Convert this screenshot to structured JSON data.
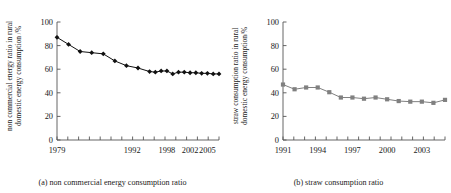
{
  "figure": {
    "panels": [
      {
        "id": "panel-a",
        "caption": "(a) non commercial energy consumption ratio",
        "ylabel": "non commercial energy ratio in rural\ndomestic energy consumption /%"
      },
      {
        "id": "panel-b",
        "caption": "(b) straw consumption ratio",
        "ylabel": "straw consumption ratio in rural\ndomestic energy consumption/%"
      }
    ]
  },
  "chart_data": [
    {
      "type": "line",
      "title": "(a) non commercial energy consumption ratio",
      "xlabel": "",
      "ylabel": "non commercial energy ratio in rural domestic energy consumption /%",
      "marker": "diamond",
      "marker_color": "#111111",
      "line_color": "#111111",
      "grid": false,
      "legend": "none",
      "xlim": [
        1979,
        2007
      ],
      "ylim": [
        0,
        100
      ],
      "yticks": [
        0,
        20,
        40,
        60,
        80,
        100
      ],
      "xticks": [
        1979,
        1992,
        1998,
        2002,
        2005
      ],
      "xtick_labels": [
        "1979",
        "1992",
        "1998",
        "2002",
        "2005"
      ],
      "x": [
        1979,
        1981,
        1983,
        1985,
        1987,
        1989,
        1991,
        1993,
        1995,
        1996,
        1997,
        1998,
        1999,
        2000,
        2001,
        2002,
        2003,
        2004,
        2005,
        2006,
        2007
      ],
      "values": [
        87,
        81,
        75,
        74,
        73,
        67,
        63,
        61,
        58,
        57.5,
        58.5,
        58.5,
        56,
        57.5,
        57.5,
        57,
        57,
        56.5,
        56.5,
        56,
        56
      ]
    },
    {
      "type": "line",
      "title": "(b) straw consumption ratio",
      "xlabel": "",
      "ylabel": "straw consumption ratio in rural domestic energy consumption/%",
      "marker": "square",
      "marker_color": "#808080",
      "line_color": "#808080",
      "grid": false,
      "legend": "none",
      "xlim": [
        1991,
        2005
      ],
      "ylim": [
        0,
        100
      ],
      "yticks": [
        0,
        20,
        40,
        60,
        80,
        100
      ],
      "xticks": [
        1991,
        1994,
        1997,
        2000,
        2003
      ],
      "xtick_labels": [
        "1991",
        "1994",
        "1997",
        "2000",
        "2003"
      ],
      "x": [
        1991,
        1992,
        1993,
        1994,
        1995,
        1996,
        1997,
        1998,
        1999,
        2000,
        2001,
        2002,
        2003,
        2004,
        2005
      ],
      "values": [
        47,
        43,
        44.5,
        44.5,
        40.5,
        36,
        36,
        35,
        36,
        34.5,
        33,
        32.5,
        32.5,
        31.5,
        34
      ]
    }
  ]
}
